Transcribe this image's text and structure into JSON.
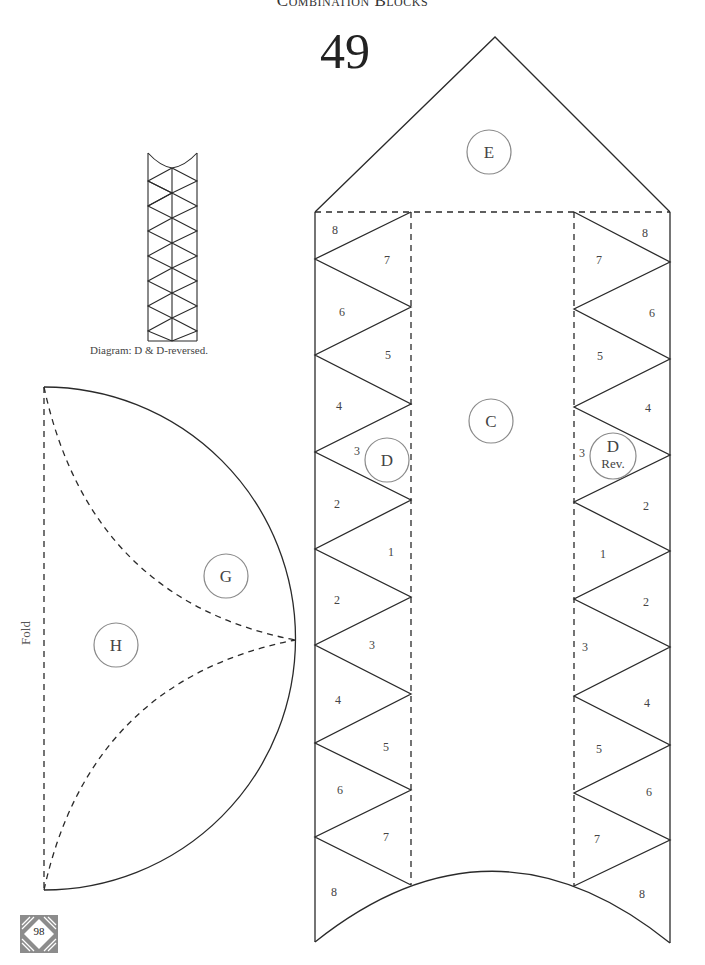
{
  "header": {
    "section_title": "Combination Blocks",
    "block_number": "49"
  },
  "diagram": {
    "caption": "Diagram: D & D-reversed.",
    "fold_label": "Fold"
  },
  "pieces": {
    "E": "E",
    "C": "C",
    "D": "D",
    "D_rev": {
      "letter": "D",
      "sub": "Rev."
    },
    "G": "G",
    "H": "H"
  },
  "left_strip_numbers": [
    "8",
    "7",
    "6",
    "5",
    "4",
    "3",
    "2",
    "1",
    "2",
    "3",
    "4",
    "5",
    "6",
    "7",
    "8"
  ],
  "right_strip_numbers": [
    "8",
    "7",
    "6",
    "5",
    "4",
    "3",
    "2",
    "1",
    "2",
    "3",
    "4",
    "5",
    "6",
    "7",
    "8"
  ],
  "footer": {
    "page_number": "98"
  },
  "colors": {
    "line": "#2a2a2a",
    "circle": "#8a8a8a",
    "badge": "#8c8c8c"
  }
}
